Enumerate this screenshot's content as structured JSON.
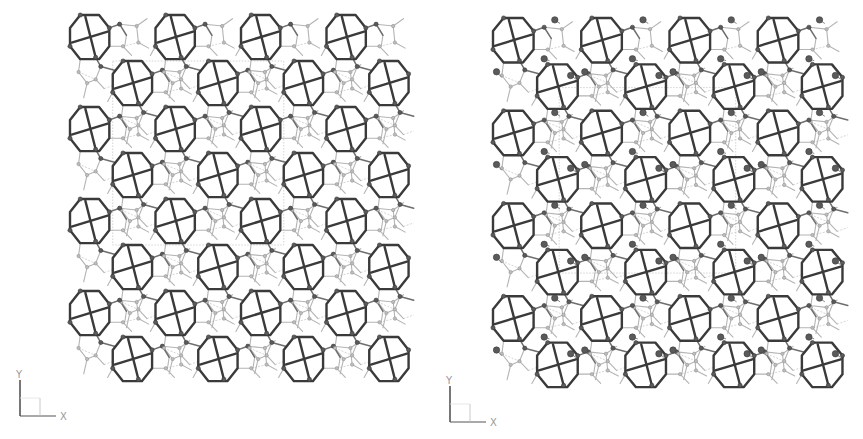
{
  "figure": {
    "background": "#ffffff"
  },
  "panels": [
    {
      "id": "left",
      "x": 70,
      "y": 15,
      "width": 342,
      "height": 368,
      "tiles_x": 4,
      "tiles_y": 4,
      "guest_molecules": false,
      "unit_cell": {
        "x0": 0.5,
        "y0": 0.5,
        "x1": 2.5,
        "y1": 2.5
      },
      "axis": {
        "x": 14,
        "y": 372,
        "x_label": "X",
        "y_label": "Y"
      }
    },
    {
      "id": "right",
      "x": 493,
      "y": 18,
      "width": 353,
      "height": 371,
      "tiles_x": 4,
      "tiles_y": 4,
      "guest_molecules": true,
      "unit_cell": {
        "x0": 0.75,
        "y0": 0.75,
        "x1": 2.75,
        "y1": 2.75
      },
      "axis": {
        "x": 444,
        "y": 378,
        "x_label": "X",
        "y_label": "Y"
      }
    }
  ],
  "motif": {
    "octagon": [
      [
        0.12,
        0.0
      ],
      [
        0.34,
        0.0
      ],
      [
        0.46,
        0.14
      ],
      [
        0.46,
        0.34
      ],
      [
        0.34,
        0.48
      ],
      [
        0.12,
        0.48
      ],
      [
        0.0,
        0.34
      ],
      [
        0.0,
        0.14
      ]
    ],
    "cross": [
      [
        [
          0.02,
          0.3
        ],
        [
          0.44,
          0.18
        ]
      ],
      [
        [
          0.18,
          0.02
        ],
        [
          0.3,
          0.46
        ]
      ]
    ],
    "connectors_mid": [
      [
        [
          0.46,
          0.14
        ],
        [
          0.58,
          0.1
        ]
      ],
      [
        [
          0.3,
          0.46
        ],
        [
          0.36,
          0.56
        ]
      ],
      [
        [
          0.36,
          0.56
        ],
        [
          0.52,
          0.6
        ]
      ],
      [
        [
          0.58,
          0.1
        ],
        [
          0.66,
          0.22
        ]
      ]
    ],
    "connectors_weak": [
      [
        [
          0.46,
          0.34
        ],
        [
          0.62,
          0.34
        ]
      ],
      [
        [
          0.62,
          0.34
        ],
        [
          0.72,
          0.44
        ]
      ],
      [
        [
          0.58,
          0.1
        ],
        [
          0.78,
          0.12
        ]
      ],
      [
        [
          0.78,
          0.12
        ],
        [
          0.9,
          0.04
        ]
      ],
      [
        [
          0.66,
          0.22
        ],
        [
          0.64,
          0.34
        ]
      ],
      [
        [
          0.12,
          0.48
        ],
        [
          0.1,
          0.62
        ]
      ],
      [
        [
          0.1,
          0.62
        ],
        [
          0.2,
          0.74
        ]
      ],
      [
        [
          0.0,
          0.34
        ],
        [
          -0.06,
          0.44
        ]
      ],
      [
        [
          0.36,
          0.56
        ],
        [
          0.3,
          0.7
        ]
      ],
      [
        [
          0.3,
          0.7
        ],
        [
          0.2,
          0.74
        ]
      ],
      [
        [
          0.2,
          0.74
        ],
        [
          0.16,
          0.9
        ]
      ],
      [
        [
          0.3,
          0.7
        ],
        [
          0.4,
          0.8
        ]
      ],
      [
        [
          0.78,
          0.12
        ],
        [
          0.8,
          0.3
        ]
      ],
      [
        [
          0.8,
          0.3
        ],
        [
          0.92,
          0.36
        ]
      ]
    ],
    "connectors_faint": [
      [
        [
          0.62,
          0.34
        ],
        [
          0.8,
          0.3
        ]
      ],
      [
        [
          0.4,
          0.8
        ],
        [
          0.52,
          0.76
        ]
      ],
      [
        [
          0.1,
          0.62
        ],
        [
          0.3,
          0.7
        ]
      ]
    ],
    "second_offset": [
      0.5,
      0.5
    ],
    "atoms_dark": [
      [
        0.58,
        0.1
      ],
      [
        0.36,
        0.56
      ],
      [
        0.46,
        0.14
      ],
      [
        0.3,
        0.46
      ],
      [
        0.12,
        0.0
      ],
      [
        0.0,
        0.34
      ]
    ],
    "atoms_light": [
      [
        0.62,
        0.34
      ],
      [
        0.78,
        0.12
      ],
      [
        0.1,
        0.62
      ],
      [
        0.3,
        0.7
      ],
      [
        0.8,
        0.3
      ],
      [
        0.2,
        0.74
      ]
    ],
    "guests": [
      {
        "from": [
          0.7,
          0.02
        ],
        "to": [
          0.76,
          0.06
        ]
      },
      {
        "from": [
          0.58,
          0.44
        ],
        "to": [
          0.64,
          0.46
        ]
      },
      {
        "from": [
          0.04,
          0.58
        ],
        "to": [
          0.1,
          0.64
        ]
      },
      {
        "from": [
          0.88,
          0.62
        ],
        "to": [
          0.94,
          0.66
        ]
      }
    ]
  }
}
